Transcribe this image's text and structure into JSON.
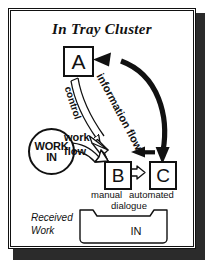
{
  "diagram": {
    "title": "In Tray Cluster",
    "nodes": {
      "a": "A",
      "b": "B",
      "c": "C",
      "work_in_line1": "WORK",
      "work_in_line2": "IN"
    },
    "flows": {
      "information_flow": "information flow",
      "control": "control",
      "work": "work",
      "flow": "flow"
    },
    "labels": {
      "manual": "manual",
      "automated": "automated",
      "dialogue": "dialogue",
      "received_work_line1": "Received",
      "received_work_line2": "Work",
      "tray": "IN"
    },
    "colors": {
      "ink": "#111111",
      "paper": "#ffffff",
      "shadow": "#2b2b2b"
    }
  }
}
